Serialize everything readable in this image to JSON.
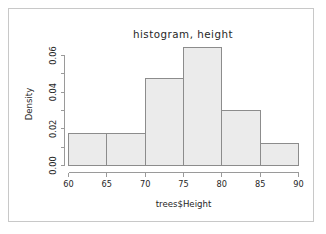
{
  "figure": {
    "frame_color": "#c8c8c8",
    "background": "#ffffff"
  },
  "chart_data": {
    "type": "bar",
    "title": "histogram, height",
    "subtitle": "",
    "xlabel": "trees$Height",
    "ylabel": "Density",
    "categories": [
      "60-65",
      "65-70",
      "70-75",
      "75-80",
      "80-85",
      "85-90"
    ],
    "bin_edges": [
      60,
      65,
      70,
      75,
      80,
      85,
      90
    ],
    "values": [
      0.0172,
      0.0172,
      0.0473,
      0.0645,
      0.0301,
      0.0118
    ],
    "counts": [
      3,
      3,
      8,
      10,
      5,
      2
    ],
    "bin_width": 5,
    "xlim": [
      60,
      90
    ],
    "ylim": [
      0.0,
      0.065
    ],
    "xticks": [
      60,
      65,
      70,
      75,
      80,
      85,
      90
    ],
    "xtick_labels": [
      "60",
      "65",
      "70",
      "75",
      "80",
      "85",
      "90"
    ],
    "yticks": [
      0.0,
      0.01,
      0.02,
      0.03,
      0.04,
      0.05,
      0.06
    ],
    "ytick_labels": [
      "0.00",
      "",
      "0.02",
      "",
      "0.04",
      "",
      "0.06"
    ],
    "ytick_labeled": [
      0.0,
      0.02,
      0.04,
      0.06
    ],
    "grid": false,
    "legend": "none",
    "bar_fill": "#ebebeb",
    "bar_border": "#8c8c8c",
    "axis_color": "#9a9a9a",
    "text_color": "#262626"
  },
  "labels": {
    "main_title": "histogram, height",
    "x_axis_title": "trees$Height",
    "y_axis_title": "Density",
    "x_ticks": [
      "60",
      "65",
      "70",
      "75",
      "80",
      "85",
      "90"
    ],
    "y_ticks": [
      "0.00",
      "0.02",
      "0.04",
      "0.06"
    ]
  }
}
